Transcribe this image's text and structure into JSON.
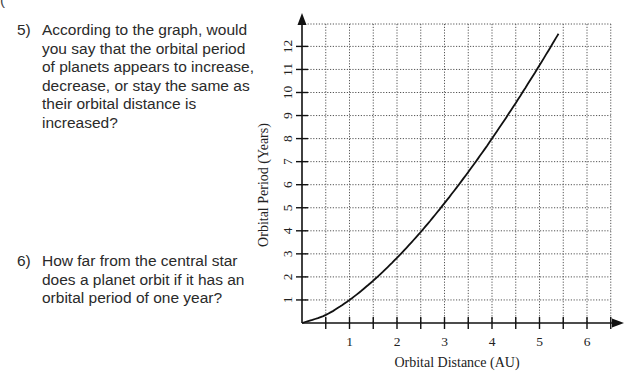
{
  "page": {
    "top_cut_text": "(",
    "questions": [
      {
        "number": "5)",
        "text": "According to the graph, would you say that the orbital period of planets appears to increase, decrease, or stay the same as their orbital distance is increased?"
      },
      {
        "number": "6)",
        "text": "How far from the central star does a planet orbit if it has an orbital period of one year?"
      }
    ]
  },
  "chart_data": {
    "type": "line",
    "title": "",
    "xlabel": "Orbital Distance (AU)",
    "ylabel": "Orbital Period (Years)",
    "x_ticks": [
      "1",
      "2",
      "3",
      "4",
      "5",
      "6"
    ],
    "y_ticks": [
      "1",
      "2",
      "3",
      "4",
      "5",
      "6",
      "7",
      "8",
      "9",
      "10",
      "11",
      "12"
    ],
    "xlim": [
      0,
      6.5
    ],
    "ylim": [
      0,
      12.8
    ],
    "grid": true,
    "grid_style": "dotted",
    "grid_x_step": 0.5,
    "grid_y_step": 1,
    "legend": null,
    "series": [
      {
        "name": "Orbital Period vs Distance",
        "x": [
          0,
          0.5,
          1,
          1.5,
          2,
          2.5,
          3,
          3.5,
          4,
          4.5,
          5,
          5.4
        ],
        "values": [
          0,
          0.35,
          1,
          1.84,
          2.83,
          3.95,
          5.2,
          6.55,
          8,
          9.55,
          11.18,
          12.55
        ]
      }
    ]
  }
}
